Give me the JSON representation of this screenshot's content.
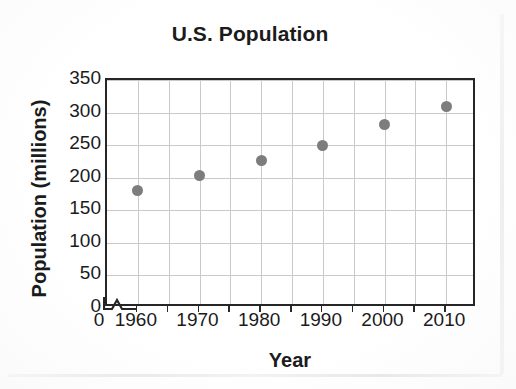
{
  "chart_data": {
    "type": "scatter",
    "title": "U.S. Population",
    "xlabel": "Year",
    "ylabel": "Population (millions)",
    "x": [
      1960,
      1970,
      1980,
      1990,
      2000,
      2010
    ],
    "values": [
      180,
      203,
      227,
      250,
      282,
      310
    ],
    "series": [
      {
        "name": "U.S. Population",
        "points": [
          {
            "x": 1960,
            "y": 180
          },
          {
            "x": 1970,
            "y": 203
          },
          {
            "x": 1980,
            "y": 227
          },
          {
            "x": 1990,
            "y": 250
          },
          {
            "x": 2000,
            "y": 282
          },
          {
            "x": 2010,
            "y": 310
          }
        ]
      }
    ],
    "xlim": [
      1955,
      2015
    ],
    "ylim": [
      0,
      350
    ],
    "x_ticks": [
      1960,
      1970,
      1980,
      1990,
      2000,
      2010
    ],
    "x_tick_labels": [
      "1960",
      "1970",
      "1980",
      "1990",
      "2000",
      "2010"
    ],
    "x_origin_label": "0",
    "x_minor_ticks": [
      1965,
      1975,
      1985,
      1995,
      2005
    ],
    "y_ticks": [
      0,
      50,
      100,
      150,
      200,
      250,
      300,
      350
    ],
    "y_tick_labels": [
      "0",
      "50",
      "100",
      "150",
      "200",
      "250",
      "300",
      "350"
    ],
    "grid": true,
    "grid_axis": "both",
    "axis_break": {
      "axis": "x",
      "present": true,
      "shape": "zigzag"
    },
    "legend": false,
    "marker": "circle",
    "marker_color": "#7d7d7d",
    "axis_color": "#262626",
    "grid_color": "#c9c9c9",
    "background": "#ffffff"
  }
}
